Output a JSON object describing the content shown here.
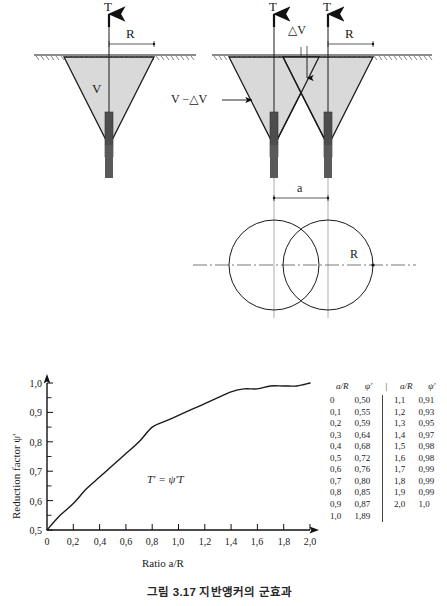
{
  "figure": {
    "caption": "그림 3.17 지반앵커의 군효과"
  },
  "diagram_single": {
    "force_label": "T",
    "radius_label": "R",
    "volume_label": "V"
  },
  "diagram_group": {
    "force_label_left": "T",
    "force_label_right": "T",
    "radius_label": "R",
    "delta_v_label": "△V",
    "net_volume_label": "V −△V"
  },
  "plan_view": {
    "spacing_label": "a",
    "radius_label": "R"
  },
  "chart_data": {
    "type": "line",
    "title": "",
    "xlabel": "Ratio a/R",
    "ylabel": "Reduction factor ψ'",
    "annotation": "T' = ψ'T",
    "xlim": [
      0,
      2.0
    ],
    "ylim": [
      0.5,
      1.0
    ],
    "grid": false,
    "legend": null,
    "xticks": [
      "0",
      "0,2",
      "0,4",
      "0,6",
      "0,8",
      "1,0",
      "1,2",
      "1,4",
      "1,6",
      "1,8",
      "2,0"
    ],
    "xtick_values": [
      0,
      0.2,
      0.4,
      0.6,
      0.8,
      1.0,
      1.2,
      1.4,
      1.6,
      1.8,
      2.0
    ],
    "yticks": [
      "0,5",
      "0,6",
      "0,7",
      "0,8",
      "0,9",
      "1,0"
    ],
    "ytick_values": [
      0.5,
      0.6,
      0.7,
      0.8,
      0.9,
      1.0
    ],
    "minor_tick_step_y": 0.05,
    "x": [
      0,
      0.1,
      0.2,
      0.3,
      0.4,
      0.5,
      0.6,
      0.7,
      0.8,
      0.9,
      1.0,
      1.1,
      1.2,
      1.3,
      1.4,
      1.5,
      1.6,
      1.7,
      1.8,
      1.9,
      2.0
    ],
    "values": [
      0.5,
      0.55,
      0.59,
      0.64,
      0.68,
      0.72,
      0.76,
      0.8,
      0.85,
      0.87,
      0.89,
      0.91,
      0.93,
      0.95,
      0.97,
      0.98,
      0.98,
      0.99,
      0.99,
      0.99,
      1.0
    ]
  },
  "table": {
    "headers": [
      "a/R",
      "ψ'",
      "a/R",
      "ψ'"
    ],
    "divider": "|",
    "left_rows": [
      [
        "0",
        "0,50"
      ],
      [
        "0,1",
        "0,55"
      ],
      [
        "0,2",
        "0,59"
      ],
      [
        "0,3",
        "0,64"
      ],
      [
        "0,4",
        "0,68"
      ],
      [
        "0,5",
        "0,72"
      ],
      [
        "0,6",
        "0,76"
      ],
      [
        "0,7",
        "0,80"
      ],
      [
        "0,8",
        "0,85"
      ],
      [
        "0,9",
        "0,87"
      ],
      [
        "1,0",
        "1,89"
      ]
    ],
    "right_rows": [
      [
        "1,1",
        "0,91"
      ],
      [
        "1,2",
        "0,93"
      ],
      [
        "1,3",
        "0,95"
      ],
      [
        "1,4",
        "0,97"
      ],
      [
        "1,5",
        "0,98"
      ],
      [
        "1,6",
        "0,98"
      ],
      [
        "1,7",
        "0,99"
      ],
      [
        "1,8",
        "0,99"
      ],
      [
        "1,9",
        "0,99"
      ],
      [
        "2,0",
        "1,0"
      ],
      [
        "",
        ""
      ]
    ]
  },
  "colors": {
    "cone_fill": "#d9d9d9",
    "line": "#1a1a1a",
    "rod": "#4d4d4d",
    "thin": "#555555"
  }
}
